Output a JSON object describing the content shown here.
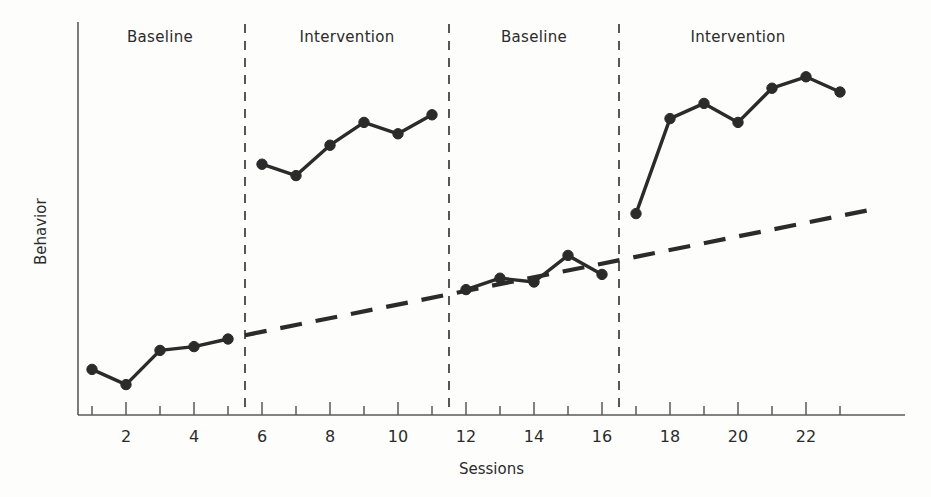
{
  "chart_data": {
    "type": "line",
    "title": "",
    "subtitle": "",
    "xlabel": "Sessions",
    "ylabel": "Behavior",
    "xlim": [
      0,
      24.5
    ],
    "ylim": [
      0,
      100
    ],
    "grid": false,
    "legend": "none",
    "design": "ABAB reversal (withdrawal) single-subject design",
    "x_ticks_major": [
      2,
      4,
      6,
      8,
      10,
      12,
      14,
      16,
      18,
      20,
      22
    ],
    "x_ticks_minor": [
      1,
      3,
      5,
      7,
      9,
      11,
      13,
      15,
      17,
      19,
      21,
      23
    ],
    "x_tick_labels": [
      "2",
      "4",
      "6",
      "8",
      "10",
      "12",
      "14",
      "16",
      "18",
      "20",
      "22"
    ],
    "y_axis_tick_labels": [],
    "phases": [
      {
        "label": "Baseline",
        "condition": "A",
        "x_start": 0.5,
        "x_end": 5.5,
        "label_x": 3.0,
        "sessions": [
          1,
          2,
          3,
          4,
          5
        ],
        "values": [
          12,
          8,
          17,
          18,
          20
        ]
      },
      {
        "label": "Intervention",
        "condition": "B",
        "x_start": 5.5,
        "x_end": 11.5,
        "label_x": 8.5,
        "sessions": [
          6,
          7,
          8,
          9,
          10,
          11
        ],
        "values": [
          66,
          63,
          71,
          77,
          74,
          79
        ]
      },
      {
        "label": "Baseline",
        "condition": "A",
        "x_start": 11.5,
        "x_end": 16.5,
        "label_x": 14.0,
        "sessions": [
          12,
          13,
          14,
          15,
          16
        ],
        "values": [
          33,
          36,
          35,
          42,
          37
        ]
      },
      {
        "label": "Intervention",
        "condition": "B",
        "x_start": 16.5,
        "x_end": 23.5,
        "label_x": 20.0,
        "sessions": [
          17,
          18,
          19,
          20,
          21,
          22,
          23
        ],
        "values": [
          53,
          78,
          82,
          77,
          86,
          89,
          85
        ]
      }
    ],
    "phase_change_lines": [
      5.5,
      11.5,
      16.5
    ],
    "trend_line": {
      "style": "dashed",
      "label": "",
      "x_start": 5.5,
      "y_start": 21,
      "x_end": 23.9,
      "y_end": 54
    },
    "series_style": {
      "marker": "filled-circle",
      "line": "solid",
      "color": "#2b2b2b"
    }
  },
  "colors": {
    "ink": "#2b2b2b",
    "axis": "#5a5a5a",
    "background": "#fdfdfb",
    "dashed": "#3a3a3a"
  }
}
